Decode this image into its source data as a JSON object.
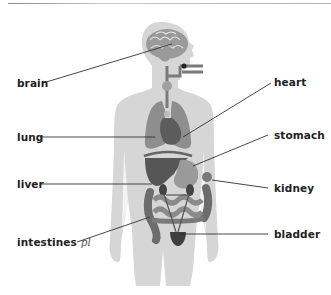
{
  "colors": {
    "body": "#d4d4d4",
    "organ_light": "#9a9a9a",
    "organ_mid": "#7d7d7d",
    "organ_dark": "#555555",
    "line": "#333333",
    "text": "#222222"
  },
  "labels": {
    "brain": "brain",
    "lung": "lung",
    "liver": "liver",
    "intestines": "intestines",
    "intestines_suffix": "pl",
    "heart": "heart",
    "stomach": "stomach",
    "kidney": "kidney",
    "bladder": "bladder"
  }
}
